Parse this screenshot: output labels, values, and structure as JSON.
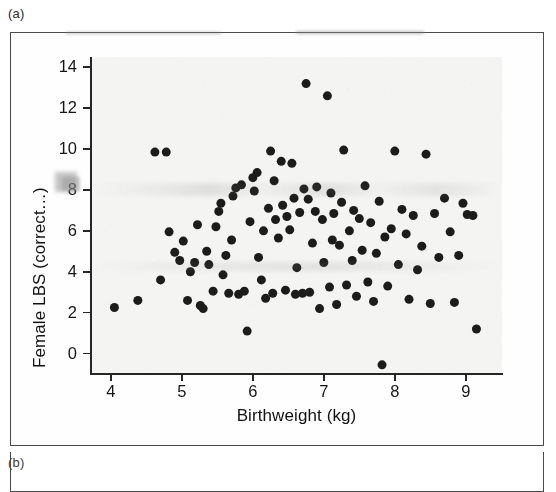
{
  "panels": {
    "current": "(a)",
    "next": "(b)"
  },
  "chart_data": {
    "type": "scatter",
    "title": "",
    "xlabel": "Birthweight (kg)",
    "ylabel": "Female LBS (correct…)",
    "xlim": [
      3.72,
      9.51
    ],
    "ylim": [
      -0.95,
      14.5
    ],
    "xticks": [
      4,
      5,
      6,
      7,
      8,
      9
    ],
    "yticks": [
      0,
      2,
      4,
      6,
      8,
      10,
      12,
      14
    ],
    "xtick_labels": [
      "4",
      "5",
      "6",
      "7",
      "8",
      "9"
    ],
    "ytick_labels": [
      "0",
      "2",
      "4",
      "6",
      "8",
      "10",
      "12",
      "14"
    ],
    "grid": false,
    "legend": null,
    "marker": {
      "shape": "circle",
      "color": "#1c1c1c",
      "size_px": 9,
      "count": 112
    },
    "points": [
      [
        4.05,
        2.25
      ],
      [
        4.38,
        2.6
      ],
      [
        4.62,
        9.85
      ],
      [
        4.78,
        9.85
      ],
      [
        4.7,
        3.6
      ],
      [
        4.82,
        5.95
      ],
      [
        4.9,
        4.95
      ],
      [
        4.97,
        4.55
      ],
      [
        5.02,
        5.5
      ],
      [
        5.08,
        2.6
      ],
      [
        5.12,
        4.0
      ],
      [
        5.18,
        4.45
      ],
      [
        5.22,
        6.3
      ],
      [
        5.26,
        2.35
      ],
      [
        5.3,
        2.2
      ],
      [
        5.35,
        5.0
      ],
      [
        5.38,
        4.35
      ],
      [
        5.44,
        3.05
      ],
      [
        5.48,
        6.2
      ],
      [
        5.52,
        6.95
      ],
      [
        5.55,
        7.35
      ],
      [
        5.58,
        3.85
      ],
      [
        5.62,
        4.8
      ],
      [
        5.66,
        2.95
      ],
      [
        5.7,
        5.55
      ],
      [
        5.72,
        7.7
      ],
      [
        5.76,
        8.1
      ],
      [
        5.8,
        2.9
      ],
      [
        5.84,
        8.25
      ],
      [
        5.88,
        3.05
      ],
      [
        5.92,
        1.1
      ],
      [
        5.96,
        6.45
      ],
      [
        6.0,
        8.6
      ],
      [
        6.02,
        7.95
      ],
      [
        6.06,
        8.85
      ],
      [
        6.08,
        4.7
      ],
      [
        6.12,
        3.6
      ],
      [
        6.15,
        6.0
      ],
      [
        6.18,
        2.7
      ],
      [
        6.22,
        7.1
      ],
      [
        6.25,
        9.9
      ],
      [
        6.28,
        2.95
      ],
      [
        6.32,
        6.55
      ],
      [
        6.36,
        5.65
      ],
      [
        6.4,
        9.4
      ],
      [
        6.42,
        7.25
      ],
      [
        6.46,
        3.1
      ],
      [
        6.48,
        6.7
      ],
      [
        6.52,
        6.05
      ],
      [
        6.55,
        9.3
      ],
      [
        6.58,
        7.6
      ],
      [
        6.6,
        2.9
      ],
      [
        6.62,
        4.2
      ],
      [
        6.66,
        6.9
      ],
      [
        6.7,
        2.95
      ],
      [
        6.72,
        8.05
      ],
      [
        6.75,
        13.2
      ],
      [
        6.78,
        7.55
      ],
      [
        6.8,
        3.0
      ],
      [
        6.84,
        5.4
      ],
      [
        6.88,
        6.95
      ],
      [
        6.9,
        8.15
      ],
      [
        6.94,
        2.2
      ],
      [
        6.98,
        6.55
      ],
      [
        7.0,
        4.45
      ],
      [
        7.05,
        12.6
      ],
      [
        7.08,
        3.25
      ],
      [
        7.1,
        7.85
      ],
      [
        7.14,
        6.85
      ],
      [
        7.18,
        2.4
      ],
      [
        7.22,
        5.3
      ],
      [
        7.25,
        7.4
      ],
      [
        7.28,
        9.95
      ],
      [
        7.32,
        3.35
      ],
      [
        7.36,
        6.0
      ],
      [
        7.4,
        4.55
      ],
      [
        7.42,
        7.0
      ],
      [
        7.46,
        2.8
      ],
      [
        7.5,
        6.6
      ],
      [
        7.54,
        5.05
      ],
      [
        7.58,
        8.2
      ],
      [
        7.62,
        3.5
      ],
      [
        7.66,
        6.4
      ],
      [
        7.7,
        2.55
      ],
      [
        7.74,
        4.9
      ],
      [
        7.78,
        7.45
      ],
      [
        7.82,
        -0.55
      ],
      [
        7.86,
        5.7
      ],
      [
        7.9,
        3.3
      ],
      [
        7.95,
        6.1
      ],
      [
        8.0,
        9.9
      ],
      [
        8.05,
        4.35
      ],
      [
        8.1,
        7.05
      ],
      [
        8.16,
        5.85
      ],
      [
        8.2,
        2.65
      ],
      [
        8.26,
        6.75
      ],
      [
        8.32,
        4.1
      ],
      [
        8.38,
        5.25
      ],
      [
        8.44,
        9.75
      ],
      [
        8.5,
        2.45
      ],
      [
        8.56,
        6.85
      ],
      [
        8.62,
        4.7
      ],
      [
        8.7,
        7.6
      ],
      [
        8.78,
        5.95
      ],
      [
        8.84,
        2.5
      ],
      [
        8.9,
        4.8
      ],
      [
        8.96,
        7.35
      ],
      [
        9.02,
        6.8
      ],
      [
        9.1,
        6.75
      ],
      [
        9.15,
        1.2
      ],
      [
        6.3,
        8.45
      ],
      [
        7.12,
        5.55
      ]
    ]
  }
}
